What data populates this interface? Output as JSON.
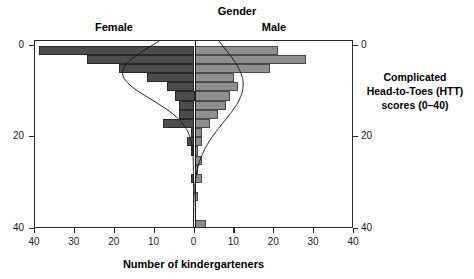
{
  "titles": {
    "gender": "Gender",
    "female": "Female",
    "male": "Male",
    "x_axis": "Number of kindergarteners",
    "y_axis": "Complicated\nHead-to-Toes (HTT)\nscores (0–40)",
    "y_axis_line1": "Complicated",
    "y_axis_line2": "Head-to-Toes (HTT)",
    "y_axis_line3": "scores (0–40)"
  },
  "axes": {
    "x_ticks": [
      "40",
      "30",
      "20",
      "10",
      "0",
      "10",
      "20",
      "30",
      "40"
    ],
    "y_ticks_left": [
      "40",
      "20",
      "0"
    ],
    "y_ticks_right": [
      "40",
      "20",
      "0"
    ]
  },
  "colors": {
    "female_bar": "#4c4c4c",
    "male_bar": "#8e8e8e",
    "axis": "#2b2b2b",
    "curve": "#1a1a1a",
    "background": "#ffffff"
  },
  "chart_data": {
    "type": "bar",
    "subtype": "back-to-back histogram (population pyramid) with overlaid normal density curves",
    "title": "Gender",
    "xlabel": "Number of kindergarteners",
    "ylabel": "Complicated Head-to-Toes (HTT) scores (0–40)",
    "xlim": [
      -40,
      40
    ],
    "ylim": [
      0,
      41
    ],
    "x_tick_values": [
      -40,
      -30,
      -20,
      -10,
      0,
      10,
      20,
      30,
      40
    ],
    "x_tick_labels": [
      "40",
      "30",
      "20",
      "10",
      "0",
      "10",
      "20",
      "30",
      "40"
    ],
    "y_tick_values": [
      0,
      20,
      40
    ],
    "y_tick_labels": [
      "0",
      "20",
      "40"
    ],
    "grid": false,
    "legend_position": "above-panels",
    "bin_width": 2,
    "categories": [
      "0–2",
      "2–4",
      "4–6",
      "6–8",
      "8–10",
      "10–12",
      "12–14",
      "14–16",
      "16–18",
      "18–20",
      "20–22",
      "22–24",
      "24–26",
      "26–28",
      "28–30",
      "30–32",
      "32–34",
      "34–36",
      "36–38",
      "38–40"
    ],
    "bin_centers": [
      1,
      3,
      5,
      7,
      9,
      11,
      13,
      15,
      17,
      19,
      21,
      23,
      25,
      27,
      29,
      31,
      33,
      35,
      37,
      39
    ],
    "series": [
      {
        "name": "Female",
        "direction": "left",
        "color": "#4c4c4c",
        "values": [
          0,
          0,
          0,
          0,
          0,
          1,
          0,
          0,
          1,
          2,
          1,
          8,
          4,
          4,
          5,
          7,
          12,
          19,
          27,
          39
        ]
      },
      {
        "name": "Male",
        "direction": "right",
        "color": "#8e8e8e",
        "values": [
          3,
          0,
          0,
          1,
          0,
          2,
          1,
          2,
          1,
          2,
          2,
          4,
          6,
          8,
          9,
          11,
          10,
          19,
          28,
          21
        ]
      }
    ],
    "annotations": [
      {
        "text": "Gender",
        "position": "top-center"
      },
      {
        "text": "Female",
        "position": "top-left-panel"
      },
      {
        "text": "Male",
        "position": "top-right-panel"
      }
    ],
    "density_curves": [
      {
        "name": "Female normal density",
        "direction": "left",
        "peak_bin": 37,
        "color": "#1a1a1a"
      },
      {
        "name": "Male normal density",
        "direction": "right",
        "peak_bin": 34,
        "color": "#1a1a1a"
      }
    ]
  }
}
